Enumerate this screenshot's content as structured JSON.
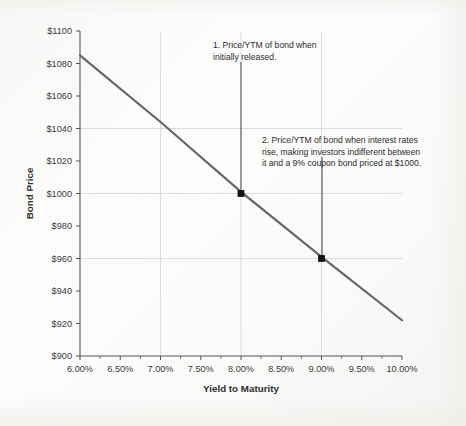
{
  "chart_data": {
    "type": "line",
    "title": "",
    "xlabel": "Yield to Maturity",
    "ylabel": "Bond Price",
    "xlim": [
      6.0,
      10.0
    ],
    "ylim": [
      900,
      1100
    ],
    "xtick_labels": [
      "6.00%",
      "6.50%",
      "7.00%",
      "7.50%",
      "8.00%",
      "8.50%",
      "9.00%",
      "9.50%",
      "10.00%"
    ],
    "xtick_values": [
      6.0,
      6.5,
      7.0,
      7.5,
      8.0,
      8.5,
      9.0,
      9.5,
      10.0
    ],
    "ytick_labels": [
      "$900",
      "$920",
      "$940",
      "$960",
      "$980",
      "$1000",
      "$1020",
      "$1040",
      "$1060",
      "$1080",
      "$1100"
    ],
    "ytick_values": [
      900,
      920,
      940,
      960,
      980,
      1000,
      1020,
      1040,
      1060,
      1080,
      1100
    ],
    "grid": "light gridlines at y = 1040, 1000, 960 and x = 7.00%, 8.00%, 9.00%",
    "grid_x_values": [
      7.0,
      8.0,
      9.0
    ],
    "grid_y_values": [
      1040,
      1000,
      960
    ],
    "legend": "none",
    "series": [
      {
        "name": "Bond price vs. yield to maturity",
        "color": "#666666",
        "x": [
          6.0,
          7.0,
          8.0,
          9.0,
          10.0
        ],
        "values": [
          1085,
          1044,
          1001,
          961,
          922
        ]
      }
    ],
    "markers": [
      {
        "label": "1",
        "x": 8.0,
        "y": 1000,
        "x_text": "8.00%",
        "y_text": "$1000"
      },
      {
        "label": "2",
        "x": 9.0,
        "y": 960,
        "x_text": "9.00%",
        "y_text": "$960"
      }
    ],
    "annotations": [
      {
        "id": "annotation-1",
        "lines": [
          "1. Price/YTM of bond when",
          "initially released."
        ],
        "points_to": {
          "x": 8.0,
          "y": 1000
        }
      },
      {
        "id": "annotation-2",
        "lines": [
          "2. Price/YTM of bond when interest rates",
          "rise, making investors indifferent between",
          "it and a 9% coupon bond priced at $1000."
        ],
        "points_to": {
          "x": 9.0,
          "y": 960
        }
      }
    ]
  },
  "axes": {
    "x_title": "Yield to Maturity",
    "y_title": "Bond Price"
  },
  "colors": {
    "line": "#666666",
    "marker": "#111111",
    "axis": "#555555",
    "grid": "#d8d8d8",
    "text": "#2b2b2b",
    "background": "#fbfbfa"
  }
}
